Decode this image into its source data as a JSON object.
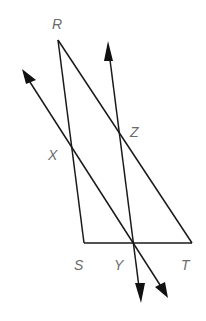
{
  "diagram": {
    "type": "geometry",
    "colors": {
      "line": "#1a1a1a",
      "label": "#6b6b6b",
      "background": "#ffffff"
    },
    "points": {
      "R": {
        "label": "R",
        "x": 58,
        "y": 40
      },
      "S": {
        "label": "S",
        "x": 84,
        "y": 243
      },
      "T": {
        "label": "T",
        "x": 192,
        "y": 243
      },
      "X": {
        "label": "X",
        "x": 72,
        "y": 146
      },
      "Y": {
        "label": "Y",
        "x": 134,
        "y": 243
      },
      "Z": {
        "label": "Z",
        "x": 119,
        "y": 129
      }
    },
    "segments": [
      {
        "from": "R",
        "to": "S"
      },
      {
        "from": "R",
        "to": "T"
      },
      {
        "from": "S",
        "to": "T"
      }
    ],
    "lines": [
      {
        "name": "line-XY",
        "through": [
          "X",
          "Y"
        ],
        "arrows": "both"
      },
      {
        "name": "line-ZY",
        "through": [
          "Z",
          "Y"
        ],
        "arrows": "both"
      }
    ],
    "labels": {
      "R": "R",
      "S": "S",
      "T": "T",
      "X": "X",
      "Y": "Y",
      "Z": "Z"
    }
  }
}
